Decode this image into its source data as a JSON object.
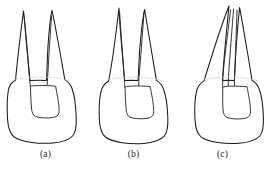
{
  "figure": {
    "background_color": "#ffffff",
    "stroke_color": "#1a1a1a",
    "canal_stroke_color": "#2b2b2b",
    "label_color": "#2a2a2a",
    "caption_a": "(a)",
    "caption_b": "(b)",
    "caption_c": "(c)",
    "panels": [
      {
        "id": "a",
        "label": "(a)",
        "icon": "tooth-two-roots-divergent-icon",
        "description": "Tooth with two widely separated pointed roots and a single wide pulp chamber in the crown"
      },
      {
        "id": "b",
        "label": "(b)",
        "icon": "tooth-two-roots-parallel-icon",
        "description": "Tooth with two narrow parallel roots joined near the crown and an elongated pulp chamber"
      },
      {
        "id": "c",
        "label": "(c)",
        "icon": "tooth-two-roots-fused-icon",
        "description": "Tooth with two fused converging roots sharing a slim central canal and a pulp chamber"
      }
    ]
  }
}
